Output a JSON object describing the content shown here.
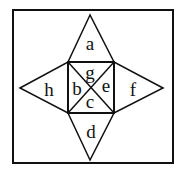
{
  "diagram": {
    "type": "net-of-square-pyramid",
    "labels": {
      "top_triangle": "a",
      "square_left": "b",
      "square_bottom": "c",
      "bottom_triangle": "d",
      "square_right": "e",
      "right_triangle": "f",
      "square_top": "g",
      "left_triangle": "h"
    },
    "colors": {
      "stroke": "#111111",
      "background": "#ffffff"
    }
  }
}
